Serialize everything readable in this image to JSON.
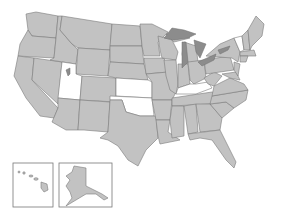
{
  "map": {
    "title": "",
    "colors": {
      "shaded": "#c2c2c2",
      "unshaded": "#ffffff",
      "lakes": "#8c8c8c",
      "border": "#7a7a7a"
    },
    "unshaded_states": [
      "Utah",
      "Kansas",
      "Oklahoma",
      "Kentucky",
      "Vermont"
    ],
    "insets": [
      "Hawaii",
      "Alaska"
    ]
  }
}
